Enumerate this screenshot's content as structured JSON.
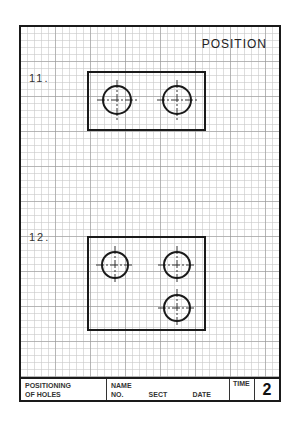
{
  "sheet": {
    "title": "POSITION",
    "problems": [
      {
        "label": "11.",
        "rect": {
          "x": 88,
          "y": 72,
          "w": 117,
          "h": 58
        },
        "holes": [
          {
            "cx": 117,
            "cy": 100,
            "r": 14
          },
          {
            "cx": 177,
            "cy": 100,
            "r": 14
          }
        ]
      },
      {
        "label": "12.",
        "rect": {
          "x": 88,
          "y": 237,
          "w": 117,
          "h": 93
        },
        "holes": [
          {
            "cx": 115,
            "cy": 265,
            "r": 13
          },
          {
            "cx": 177,
            "cy": 265,
            "r": 13
          },
          {
            "cx": 177,
            "cy": 308,
            "r": 13
          }
        ]
      }
    ]
  },
  "title_block": {
    "subject_line1": "POSITIONING",
    "subject_line2": "OF HOLES",
    "name_label": "NAME",
    "no_label": "NO.",
    "sect_label": "SECT",
    "date_label": "DATE",
    "time_label": "TIME",
    "sheet_number": "2"
  },
  "colors": {
    "line": "#1a1a1a",
    "grid": "#c8c8c8"
  }
}
